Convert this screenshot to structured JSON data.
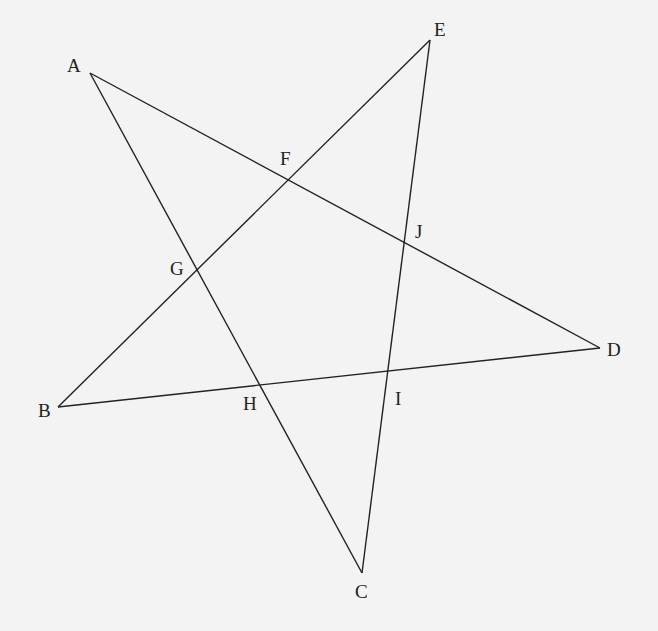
{
  "diagram": {
    "type": "pentagram",
    "background": "#f3f3f3",
    "line_color": "#222222",
    "vertices": {
      "A": [
        90,
        73
      ],
      "B": [
        58,
        407
      ],
      "C": [
        362,
        573
      ],
      "D": [
        600,
        348
      ],
      "E": [
        430,
        40
      ]
    },
    "segments": [
      {
        "from": "A",
        "to": "D"
      },
      {
        "from": "A",
        "to": "C"
      },
      {
        "from": "B",
        "to": "E"
      },
      {
        "from": "B",
        "to": "D"
      },
      {
        "from": "E",
        "to": "C"
      }
    ],
    "labels": [
      {
        "text": "A",
        "x": 67,
        "y": 72
      },
      {
        "text": "E",
        "x": 434,
        "y": 36
      },
      {
        "text": "D",
        "x": 607,
        "y": 356
      },
      {
        "text": "B",
        "x": 38,
        "y": 417
      },
      {
        "text": "C",
        "x": 355,
        "y": 598
      },
      {
        "text": "F",
        "x": 280,
        "y": 165
      },
      {
        "text": "G",
        "x": 170,
        "y": 275
      },
      {
        "text": "J",
        "x": 415,
        "y": 238
      },
      {
        "text": "H",
        "x": 243,
        "y": 410
      },
      {
        "text": "I",
        "x": 395,
        "y": 405
      }
    ],
    "intersections": {
      "F": [
        290,
        180
      ],
      "G": [
        197,
        268
      ],
      "J": [
        404,
        243
      ],
      "H": [
        261,
        386
      ],
      "I": [
        387,
        373
      ]
    }
  }
}
